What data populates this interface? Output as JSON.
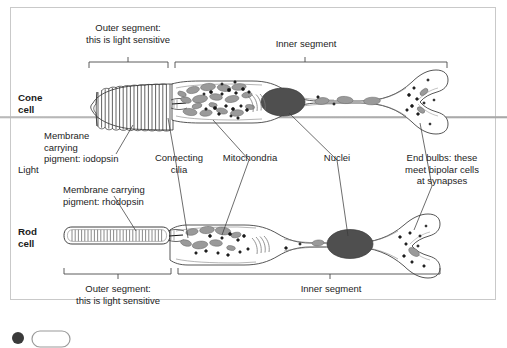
{
  "diagram": {
    "frame_color": "#c9c9c9",
    "cell_outline_color": "#2b2b2b",
    "organelle_fill": "#8f8f8f",
    "nucleus_fill": "#4a4a4a",
    "light_ray_color": "#9a9a9a"
  },
  "cone": {
    "row_label_line1": "Cone",
    "row_label_line2": "cell",
    "outer_segment_label_line1": "Outer segment:",
    "outer_segment_label_line2": "this is light sensitive",
    "inner_segment_label": "Inner segment",
    "membrane_label_line1": "Membrane",
    "membrane_label_line2": "carrying",
    "membrane_label_line3": "pigment:  iodopsin"
  },
  "rod": {
    "row_label_line1": "Rod",
    "row_label_line2": "cell",
    "outer_segment_label_line1": "Outer segment:",
    "outer_segment_label_line2": "this is light sensitive",
    "inner_segment_label": "Inner segment",
    "membrane_label_line1": "Membrane carrying",
    "membrane_label_line2": "pigment: rhodopsin"
  },
  "shared_labels": {
    "light": "Light",
    "connecting_cilia_line1": "Connecting",
    "connecting_cilia_line2": "cilia",
    "mitochondria": "Mitochondria",
    "nuclei": "Nuclei",
    "end_bulbs_line1": "End bulbs: these",
    "end_bulbs_line2": "meet bipolar cells",
    "end_bulbs_line3": "at synapses"
  }
}
